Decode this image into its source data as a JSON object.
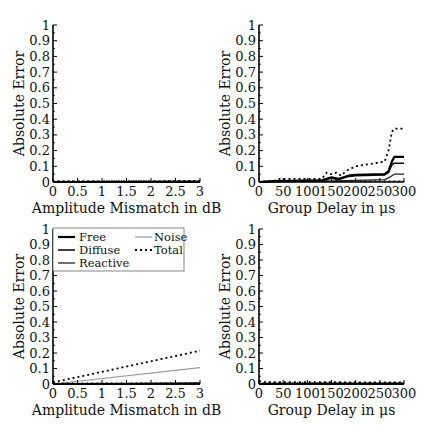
{
  "chart_data": [
    {
      "id": "top-left",
      "type": "line",
      "title": "",
      "xlabel": "Amplitude Mismatch in dB",
      "ylabel": "Absolute Error",
      "xlim": [
        0,
        3
      ],
      "ylim": [
        0,
        1
      ],
      "xticks": [
        "0",
        "0.5",
        "1",
        "1.5",
        "2",
        "2.5",
        "3"
      ],
      "yticks": [
        "0",
        "0.1",
        "0.2",
        "0.3",
        "0.4",
        "0.5",
        "0.6",
        "0.7",
        "0.8",
        "0.9",
        "1"
      ],
      "grid": false,
      "series": [
        {
          "name": "Free",
          "x": [
            0,
            3
          ],
          "y": [
            0,
            0.002
          ]
        },
        {
          "name": "Diffuse",
          "x": [
            0,
            3
          ],
          "y": [
            0,
            0.002
          ]
        },
        {
          "name": "Reactive",
          "x": [
            0,
            3
          ],
          "y": [
            0,
            0.002
          ]
        },
        {
          "name": "Noise",
          "x": [
            0,
            3
          ],
          "y": [
            0,
            0.002
          ]
        },
        {
          "name": "Total",
          "x": [
            0,
            3
          ],
          "y": [
            0.003,
            0.005
          ]
        }
      ]
    },
    {
      "id": "top-right",
      "type": "line",
      "title": "",
      "xlabel": "Group Delay in μs",
      "ylabel": "Absolute Error",
      "xlim": [
        0,
        300
      ],
      "ylim": [
        0,
        1
      ],
      "xticks": [
        "0",
        "50",
        "100",
        "150",
        "200",
        "250",
        "300"
      ],
      "yticks": [
        "0",
        "0.1",
        "0.2",
        "0.3",
        "0.4",
        "0.5",
        "0.6",
        "0.7",
        "0.8",
        "0.9",
        "1"
      ],
      "grid": false,
      "series": [
        {
          "name": "Free",
          "x": [
            0,
            30,
            130,
            150,
            165,
            175,
            185,
            200,
            260,
            268,
            275,
            280,
            300
          ],
          "y": [
            0,
            0.005,
            0.01,
            0.03,
            0.02,
            0.03,
            0.04,
            0.045,
            0.05,
            0.07,
            0.13,
            0.16,
            0.16
          ]
        },
        {
          "name": "Diffuse",
          "x": [
            0,
            30,
            130,
            150,
            165,
            175,
            185,
            200,
            260,
            268,
            275,
            280,
            300
          ],
          "y": [
            0,
            0.005,
            0.01,
            0.025,
            0.015,
            0.025,
            0.035,
            0.04,
            0.045,
            0.06,
            0.11,
            0.12,
            0.12
          ]
        },
        {
          "name": "Reactive",
          "x": [
            0,
            30,
            130,
            180,
            200,
            260,
            270,
            280,
            300
          ],
          "y": [
            0,
            0.003,
            0.005,
            0.008,
            0.01,
            0.015,
            0.03,
            0.05,
            0.05
          ]
        },
        {
          "name": "Noise",
          "x": [
            0,
            100,
            200,
            300
          ],
          "y": [
            0,
            0.002,
            0.004,
            0.005
          ]
        },
        {
          "name": "Total",
          "x": [
            0,
            30,
            40,
            130,
            140,
            150,
            160,
            170,
            180,
            200,
            260,
            268,
            275,
            280,
            300
          ],
          "y": [
            0,
            0.005,
            0.02,
            0.02,
            0.06,
            0.05,
            0.06,
            0.04,
            0.07,
            0.1,
            0.13,
            0.2,
            0.32,
            0.34,
            0.34
          ]
        }
      ]
    },
    {
      "id": "bottom-left",
      "type": "line",
      "title": "",
      "xlabel": "Amplitude Mismatch in dB",
      "ylabel": "Absolute Error",
      "xlim": [
        0,
        3
      ],
      "ylim": [
        0,
        1
      ],
      "xticks": [
        "0",
        "0.5",
        "1",
        "1.5",
        "2",
        "2.5",
        "3"
      ],
      "yticks": [
        "0",
        "0.1",
        "0.2",
        "0.3",
        "0.4",
        "0.5",
        "0.6",
        "0.7",
        "0.8",
        "0.9",
        "1"
      ],
      "grid": false,
      "legend": {
        "position": "upper left",
        "entries": [
          "Free",
          "Diffuse",
          "Reactive",
          "Noise",
          "Total"
        ]
      },
      "series": [
        {
          "name": "Free",
          "x": [
            0,
            3
          ],
          "y": [
            0,
            0.003
          ]
        },
        {
          "name": "Diffuse",
          "x": [
            0,
            3
          ],
          "y": [
            0,
            0.003
          ]
        },
        {
          "name": "Reactive",
          "x": [
            0,
            3
          ],
          "y": [
            0,
            0.003
          ]
        },
        {
          "name": "Noise",
          "x": [
            0,
            3
          ],
          "y": [
            0,
            0.105
          ]
        },
        {
          "name": "Total",
          "x": [
            0,
            3
          ],
          "y": [
            0.01,
            0.215
          ]
        }
      ]
    },
    {
      "id": "bottom-right",
      "type": "line",
      "title": "",
      "xlabel": "Group Delay in μs",
      "ylabel": "Absolute Error",
      "xlim": [
        0,
        300
      ],
      "ylim": [
        0,
        1
      ],
      "xticks": [
        "0",
        "50",
        "100",
        "150",
        "200",
        "250",
        "300"
      ],
      "yticks": [
        "0",
        "0.1",
        "0.2",
        "0.3",
        "0.4",
        "0.5",
        "0.6",
        "0.7",
        "0.8",
        "0.9",
        "1"
      ],
      "grid": false,
      "series": [
        {
          "name": "Free",
          "x": [
            0,
            300
          ],
          "y": [
            0,
            0.002
          ]
        },
        {
          "name": "Diffuse",
          "x": [
            0,
            300
          ],
          "y": [
            0,
            0.002
          ]
        },
        {
          "name": "Reactive",
          "x": [
            0,
            300
          ],
          "y": [
            0,
            0.002
          ]
        },
        {
          "name": "Noise",
          "x": [
            0,
            300
          ],
          "y": [
            0.005,
            0.005
          ]
        },
        {
          "name": "Total",
          "x": [
            0,
            10,
            300
          ],
          "y": [
            0.02,
            0.012,
            0.01
          ]
        }
      ]
    }
  ],
  "series_styles": {
    "Free": {
      "color": "#000000",
      "width": 2.2,
      "dash": ""
    },
    "Diffuse": {
      "color": "#111111",
      "width": 1.6,
      "dash": ""
    },
    "Reactive": {
      "color": "#222222",
      "width": 1.3,
      "dash": ""
    },
    "Noise": {
      "color": "#9a9a9a",
      "width": 1.2,
      "dash": ""
    },
    "Total": {
      "color": "#000000",
      "width": 1.8,
      "dash": "2,3"
    }
  },
  "legend_labels": {
    "free": "Free",
    "diffuse": "Diffuse",
    "reactive": "Reactive",
    "noise": "Noise",
    "total": "Total"
  }
}
